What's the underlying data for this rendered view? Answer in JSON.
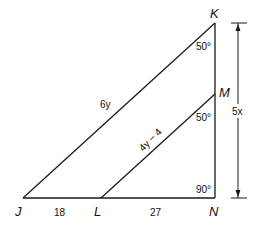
{
  "diagram": {
    "type": "geometry-triangle",
    "line_color": "#1a1a1a",
    "background": "#ffffff",
    "vertices": {
      "K": {
        "label": "K",
        "x": 215,
        "y": 23
      },
      "M": {
        "label": "M",
        "x": 215,
        "y": 94
      },
      "N": {
        "label": "N",
        "x": 215,
        "y": 198
      },
      "J": {
        "label": "J",
        "x": 23,
        "y": 198
      },
      "L": {
        "label": "L",
        "x": 101,
        "y": 198
      }
    },
    "angles": {
      "K": "50°",
      "M": "50°",
      "N": "90°"
    },
    "sides": {
      "JK": "6y",
      "LM": "4y − 4",
      "JL": "18",
      "LN": "27",
      "KN": "5x"
    }
  }
}
